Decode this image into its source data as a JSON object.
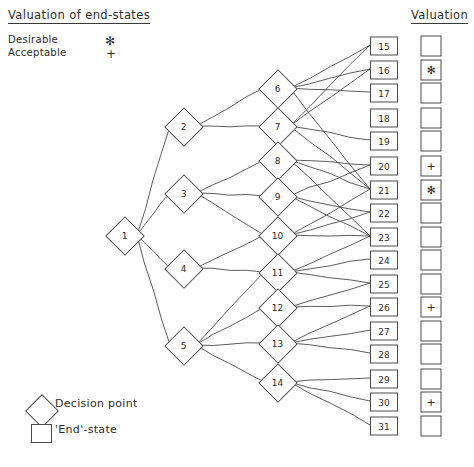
{
  "titles": {
    "endstates": "Valuation of end-states",
    "valuation": "Valuation"
  },
  "legend": {
    "desirable_label": "Desirable",
    "desirable_symbol": "✻",
    "acceptable_label": "Acceptable",
    "acceptable_symbol": "+"
  },
  "key": {
    "decision_label": "Decision point",
    "end_label": "'End'-state"
  },
  "colors": {
    "stroke": "#4a4a4a",
    "text": "#2b2b2b",
    "background": "#ffffff"
  },
  "chart_data": {
    "type": "diagram",
    "title": "Valuation of end-states",
    "decision_nodes": [
      {
        "id": "1",
        "label": "1",
        "x": 124,
        "y": 235
      },
      {
        "id": "2",
        "label": "2",
        "x": 183,
        "y": 126
      },
      {
        "id": "3",
        "label": "3",
        "x": 183,
        "y": 193
      },
      {
        "id": "4",
        "label": "4",
        "x": 183,
        "y": 268
      },
      {
        "id": "5",
        "label": "5",
        "x": 183,
        "y": 345
      },
      {
        "id": "6",
        "label": "6",
        "x": 277,
        "y": 88
      },
      {
        "id": "7",
        "label": "7",
        "x": 277,
        "y": 126
      },
      {
        "id": "8",
        "label": "8",
        "x": 277,
        "y": 160
      },
      {
        "id": "9",
        "label": "9",
        "x": 277,
        "y": 196
      },
      {
        "id": "10",
        "label": "10",
        "x": 277,
        "y": 235
      },
      {
        "id": "11",
        "label": "11",
        "x": 277,
        "y": 272
      },
      {
        "id": "12",
        "label": "12",
        "x": 277,
        "y": 307
      },
      {
        "id": "13",
        "label": "13",
        "x": 277,
        "y": 343
      },
      {
        "id": "14",
        "label": "14",
        "x": 277,
        "y": 382
      }
    ],
    "end_states": [
      {
        "id": "15",
        "label": "15",
        "x": 383,
        "y": 45,
        "valuation": ""
      },
      {
        "id": "16",
        "label": "16",
        "x": 383,
        "y": 69,
        "valuation": "✻"
      },
      {
        "id": "17",
        "label": "17",
        "x": 383,
        "y": 92,
        "valuation": ""
      },
      {
        "id": "18",
        "label": "18",
        "x": 383,
        "y": 117,
        "valuation": ""
      },
      {
        "id": "19",
        "label": "19",
        "x": 383,
        "y": 140,
        "valuation": ""
      },
      {
        "id": "20",
        "label": "20",
        "x": 383,
        "y": 165,
        "valuation": "+"
      },
      {
        "id": "21",
        "label": "21",
        "x": 383,
        "y": 189,
        "valuation": "✻"
      },
      {
        "id": "22",
        "label": "22",
        "x": 383,
        "y": 212,
        "valuation": ""
      },
      {
        "id": "23",
        "label": "23",
        "x": 383,
        "y": 236,
        "valuation": ""
      },
      {
        "id": "24",
        "label": "24",
        "x": 383,
        "y": 259,
        "valuation": ""
      },
      {
        "id": "25",
        "label": "25",
        "x": 383,
        "y": 283,
        "valuation": ""
      },
      {
        "id": "26",
        "label": "26",
        "x": 383,
        "y": 306,
        "valuation": "+"
      },
      {
        "id": "27",
        "label": "27",
        "x": 383,
        "y": 330,
        "valuation": ""
      },
      {
        "id": "28",
        "label": "28",
        "x": 383,
        "y": 353,
        "valuation": ""
      },
      {
        "id": "29",
        "label": "29",
        "x": 383,
        "y": 378,
        "valuation": ""
      },
      {
        "id": "30",
        "label": "30",
        "x": 383,
        "y": 401,
        "valuation": "+"
      },
      {
        "id": "31",
        "label": "31",
        "x": 383,
        "y": 425,
        "valuation": ""
      }
    ],
    "valuation_column_x": 430,
    "edges": [
      [
        "1",
        "2"
      ],
      [
        "1",
        "3"
      ],
      [
        "1",
        "4"
      ],
      [
        "1",
        "5"
      ],
      [
        "2",
        "6"
      ],
      [
        "2",
        "7"
      ],
      [
        "3",
        "8"
      ],
      [
        "3",
        "9"
      ],
      [
        "3",
        "10"
      ],
      [
        "4",
        "10"
      ],
      [
        "4",
        "11"
      ],
      [
        "5",
        "11"
      ],
      [
        "5",
        "12"
      ],
      [
        "5",
        "13"
      ],
      [
        "5",
        "14"
      ],
      [
        "6",
        "15"
      ],
      [
        "6",
        "16"
      ],
      [
        "6",
        "17"
      ],
      [
        "6",
        "21"
      ],
      [
        "7",
        "15"
      ],
      [
        "7",
        "16"
      ],
      [
        "7",
        "19"
      ],
      [
        "7",
        "21"
      ],
      [
        "8",
        "20"
      ],
      [
        "8",
        "21"
      ],
      [
        "8",
        "23"
      ],
      [
        "9",
        "20"
      ],
      [
        "9",
        "22"
      ],
      [
        "9",
        "23"
      ],
      [
        "10",
        "21"
      ],
      [
        "10",
        "22"
      ],
      [
        "10",
        "23"
      ],
      [
        "11",
        "23"
      ],
      [
        "11",
        "24"
      ],
      [
        "11",
        "25"
      ],
      [
        "12",
        "25"
      ],
      [
        "12",
        "26"
      ],
      [
        "13",
        "26"
      ],
      [
        "13",
        "27"
      ],
      [
        "13",
        "28"
      ],
      [
        "14",
        "29"
      ],
      [
        "14",
        "30"
      ],
      [
        "14",
        "31"
      ]
    ]
  }
}
